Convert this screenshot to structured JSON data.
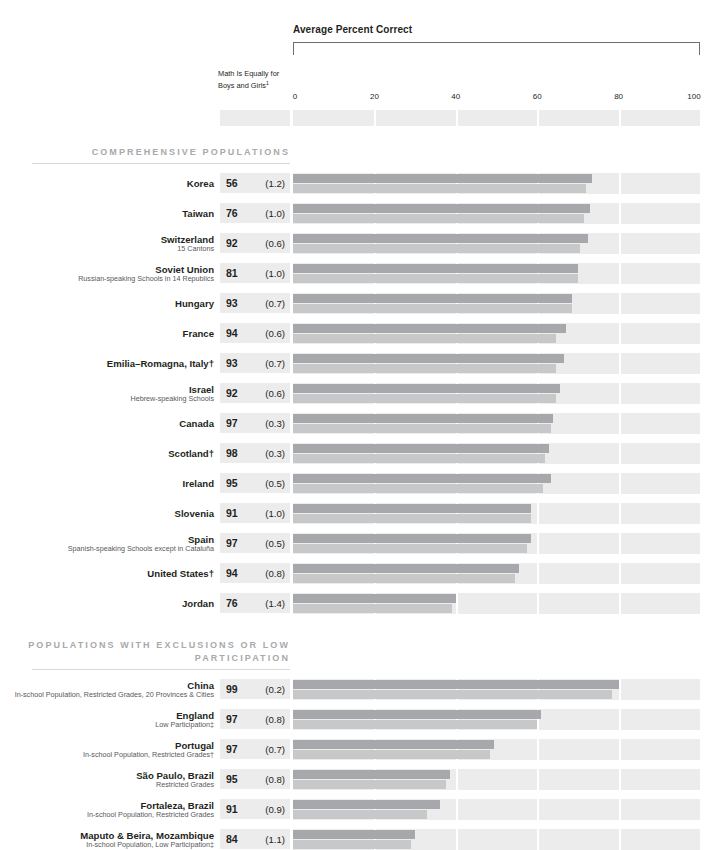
{
  "chart_title": "Average Percent Correct",
  "column_header": "Math Is Equally for Boys and Girls",
  "column_header_footnote": "1",
  "axis": {
    "ticks": [
      "0",
      "20",
      "40",
      "60",
      "80",
      "100"
    ],
    "min": 0,
    "max": 100
  },
  "colors": {
    "bar_upper": "#a6a8ab",
    "bar_lower": "#c7c8ca",
    "track": "#ececec",
    "value_box": "#ececec",
    "section_title": "#a7a9ac",
    "text": "#231f20",
    "subtext": "#58595b"
  },
  "sections": [
    {
      "title": "COMPREHENSIVE POPULATIONS",
      "rows": [
        {
          "name": "Korea",
          "sub": "",
          "pct": "56",
          "se": "(1.2)",
          "upper": 73.5,
          "lower": 72.0
        },
        {
          "name": "Taiwan",
          "sub": "",
          "pct": "76",
          "se": "(1.0)",
          "upper": 73.0,
          "lower": 71.5
        },
        {
          "name": "Switzerland",
          "sub": "15 Cantons",
          "pct": "92",
          "se": "(0.6)",
          "upper": 72.5,
          "lower": 70.5
        },
        {
          "name": "Soviet Union",
          "sub": "Russian-speaking Schools in 14 Republics",
          "pct": "81",
          "se": "(1.0)",
          "upper": 70.0,
          "lower": 70.0
        },
        {
          "name": "Hungary",
          "sub": "",
          "pct": "93",
          "se": "(0.7)",
          "upper": 68.5,
          "lower": 68.5
        },
        {
          "name": "France",
          "sub": "",
          "pct": "94",
          "se": "(0.6)",
          "upper": 67.0,
          "lower": 64.5
        },
        {
          "name": "Emilia–Romagna, Italy†",
          "sub": "",
          "pct": "93",
          "se": "(0.7)",
          "upper": 66.5,
          "lower": 64.5
        },
        {
          "name": "Israel",
          "sub": "Hebrew-speaking Schools",
          "pct": "92",
          "se": "(0.6)",
          "upper": 65.5,
          "lower": 64.5
        },
        {
          "name": "Canada",
          "sub": "",
          "pct": "97",
          "se": "(0.3)",
          "upper": 64.0,
          "lower": 63.5
        },
        {
          "name": "Scotland†",
          "sub": "",
          "pct": "98",
          "se": "(0.3)",
          "upper": 63.0,
          "lower": 62.0
        },
        {
          "name": "Ireland",
          "sub": "",
          "pct": "95",
          "se": "(0.5)",
          "upper": 63.5,
          "lower": 61.5
        },
        {
          "name": "Slovenia",
          "sub": "",
          "pct": "91",
          "se": "(1.0)",
          "upper": 58.5,
          "lower": 58.5
        },
        {
          "name": "Spain",
          "sub": "Spanish-speaking Schools except in Cataluña",
          "pct": "97",
          "se": "(0.5)",
          "upper": 58.5,
          "lower": 57.5
        },
        {
          "name": "United States†",
          "sub": "",
          "pct": "94",
          "se": "(0.8)",
          "upper": 55.5,
          "lower": 54.5
        },
        {
          "name": "Jordan",
          "sub": "",
          "pct": "76",
          "se": "(1.4)",
          "upper": 40.0,
          "lower": 39.0
        }
      ]
    },
    {
      "title": "POPULATIONS WITH EXCLUSIONS OR LOW PARTICIPATION",
      "rows": [
        {
          "name": "China",
          "sub": "In-school Population, Restricted Grades, 20 Provinces & Cities",
          "pct": "99",
          "se": "(0.2)",
          "upper": 80.0,
          "lower": 78.5
        },
        {
          "name": "England",
          "sub": "Low Participation‡",
          "pct": "97",
          "se": "(0.8)",
          "upper": 61.0,
          "lower": 60.0
        },
        {
          "name": "Portugal",
          "sub": "In-school Population, Restricted  Grades†",
          "pct": "97",
          "se": "(0.7)",
          "upper": 49.5,
          "lower": 48.5
        },
        {
          "name": "São Paulo, Brazil",
          "sub": "Restricted Grades",
          "pct": "95",
          "se": "(0.8)",
          "upper": 38.5,
          "lower": 37.5
        },
        {
          "name": "Fortaleza, Brazil",
          "sub": "In-school Population, Restricted Grades",
          "pct": "91",
          "se": "(0.9)",
          "upper": 36.0,
          "lower": 33.0
        },
        {
          "name": "Maputo & Beira, Mozambique",
          "sub": "In-school Population, Low Participation‡",
          "pct": "84",
          "se": "(1.1)",
          "upper": 30.0,
          "lower": 29.0
        }
      ]
    }
  ],
  "chart_data": {
    "type": "bar",
    "title": "Average Percent Correct",
    "xlabel": "Average Percent Correct",
    "ylabel": "",
    "xlim": [
      0,
      100
    ],
    "grid": true,
    "legend_position": "none",
    "categories": [
      "Korea",
      "Taiwan",
      "Switzerland",
      "Soviet Union",
      "Hungary",
      "France",
      "Emilia–Romagna, Italy†",
      "Israel",
      "Canada",
      "Scotland†",
      "Ireland",
      "Slovenia",
      "Spain",
      "United States†",
      "Jordan",
      "China",
      "England",
      "Portugal",
      "São Paulo, Brazil",
      "Fortaleza, Brazil",
      "Maputo & Beira, Mozambique"
    ],
    "series": [
      {
        "name": "upper bar",
        "values": [
          73.5,
          73.0,
          72.5,
          70.0,
          68.5,
          67.0,
          66.5,
          65.5,
          64.0,
          63.0,
          63.5,
          58.5,
          58.5,
          55.5,
          40.0,
          80.0,
          61.0,
          49.5,
          38.5,
          36.0,
          30.0
        ]
      },
      {
        "name": "lower bar",
        "values": [
          72.0,
          71.5,
          70.5,
          70.0,
          68.5,
          64.5,
          64.5,
          64.5,
          63.5,
          62.0,
          61.5,
          58.5,
          57.5,
          54.5,
          39.0,
          78.5,
          60.0,
          48.5,
          37.5,
          33.0,
          29.0
        ]
      }
    ],
    "annotations": {
      "math_is_equally_for_boys_and_girls_percent": [
        56,
        76,
        92,
        81,
        93,
        94,
        93,
        92,
        97,
        98,
        95,
        91,
        97,
        94,
        76,
        99,
        97,
        97,
        95,
        91,
        84
      ],
      "standard_errors": [
        "(1.2)",
        "(1.0)",
        "(0.6)",
        "(1.0)",
        "(0.7)",
        "(0.6)",
        "(0.7)",
        "(0.6)",
        "(0.3)",
        "(0.3)",
        "(0.5)",
        "(1.0)",
        "(0.5)",
        "(0.8)",
        "(1.4)",
        "(0.2)",
        "(0.8)",
        "(0.7)",
        "(0.8)",
        "(0.9)",
        "(1.1)"
      ]
    }
  }
}
